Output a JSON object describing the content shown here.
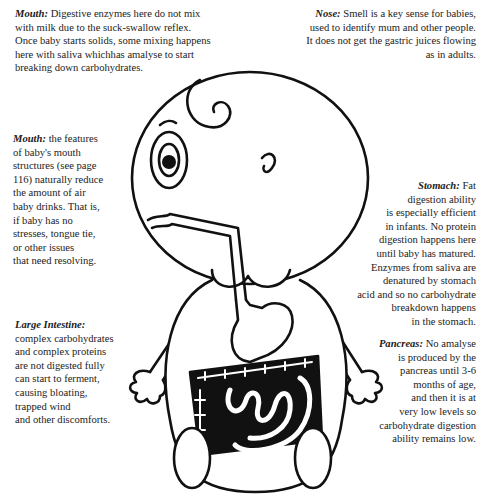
{
  "notes": {
    "mouth_top": {
      "title": "Mouth:",
      "lines": [
        "Digestive enzymes here do not mix",
        "with milk due to the suck-swallow reflex.",
        "Once baby starts solids, some mixing happens",
        "here with saliva whichhas amalyse to start",
        "breaking down carbohydrates."
      ]
    },
    "nose": {
      "title": "Nose:",
      "lines": [
        "Smell is a key sense for babies,",
        "used to identify mum and other people.",
        "It does not get the gastric juices flowing",
        "as in adults."
      ]
    },
    "mouth_left": {
      "title": "Mouth:",
      "lines": [
        "the features",
        "of  baby's mouth",
        "structures (see page",
        "116) naturally reduce",
        "the amount of air",
        "baby drinks. That is,",
        "if  baby has no",
        "stresses, tongue tie,",
        "or other issues",
        "that need resolving."
      ]
    },
    "stomach": {
      "title": "Stomach:",
      "lines": [
        "Fat",
        "digestion ability",
        "is especially efficient",
        "in infants. No protein",
        "digestion happens here",
        "until baby has matured.",
        "Enzymes from saliva are",
        "denatured by stomach",
        "acid and so no carbohydrate",
        "breakdown happens",
        "in the stomach."
      ]
    },
    "large_intestine": {
      "title": "Large Intestine:",
      "lines": [
        "complex carbohydrates",
        "and complex proteins",
        "are not digested fully",
        "can start to ferment,",
        "causing bloating,",
        "trapped wind",
        "and other discomforts."
      ]
    },
    "pancreas": {
      "title": "Pancreas:",
      "lines": [
        "No amalyse",
        "is  produced by the",
        "pancreas until 3-6",
        "months of age,",
        "and then it is at",
        "very  low levels so",
        "carbohydrate  digestion",
        "ability remains low."
      ]
    }
  }
}
